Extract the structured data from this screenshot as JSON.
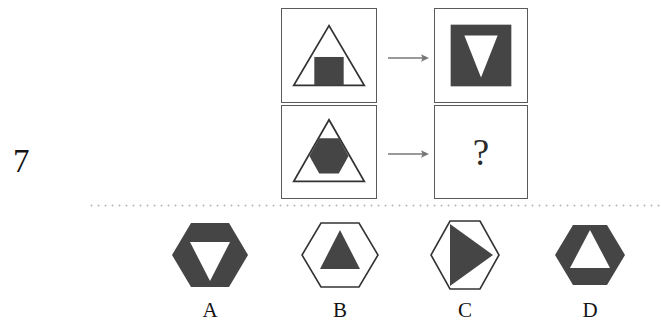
{
  "puzzle": {
    "question_number": "7",
    "question_mark": "?",
    "arrow_glyph": "→",
    "colors": {
      "fill_dark": "#454545",
      "stroke_dark": "#333333",
      "panel_border": "#5a5a5a",
      "arrow": "#777777",
      "divider": "#b9b9b9",
      "background": "#ffffff"
    }
  },
  "matrix": {
    "rows": [
      {
        "source": {
          "label": "triangle-outline-with-dark-square",
          "outer_shape": "triangle",
          "outer_fill": "none",
          "inner_shape": "square",
          "inner_fill": "dark"
        },
        "result": {
          "label": "dark-square-with-white-inverted-triangle",
          "outer_shape": "square",
          "outer_fill": "dark",
          "inner_shape": "triangle-down",
          "inner_fill": "white"
        }
      },
      {
        "source": {
          "label": "triangle-outline-with-dark-hexagon",
          "outer_shape": "triangle",
          "outer_fill": "none",
          "inner_shape": "hexagon",
          "inner_fill": "dark"
        },
        "result": {
          "label": "unknown-answer",
          "outer_shape": "unknown",
          "outer_fill": "none",
          "inner_shape": "unknown",
          "inner_fill": "none"
        }
      }
    ]
  },
  "options": [
    {
      "label": "A",
      "name": "dark-hexagon-with-white-down-triangle",
      "outer_shape": "hexagon",
      "outer_fill": "dark",
      "inner_shape": "triangle-down",
      "inner_fill": "white"
    },
    {
      "label": "B",
      "name": "outline-hexagon-with-dark-up-triangle",
      "outer_shape": "hexagon",
      "outer_fill": "none",
      "inner_shape": "triangle-up",
      "inner_fill": "dark"
    },
    {
      "label": "C",
      "name": "outline-hexagon-with-dark-right-triangle",
      "outer_shape": "hexagon",
      "outer_fill": "none",
      "inner_shape": "triangle-right",
      "inner_fill": "dark"
    },
    {
      "label": "D",
      "name": "dark-hexagon-with-white-up-triangle",
      "outer_shape": "hexagon",
      "outer_fill": "dark",
      "inner_shape": "triangle-up",
      "inner_fill": "white"
    }
  ]
}
